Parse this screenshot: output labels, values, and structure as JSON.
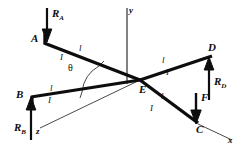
{
  "figure": {
    "background": "#ffffff",
    "ink": "#0d0d0d",
    "width": 237,
    "height": 149
  },
  "joints": {
    "a": {
      "label": "A",
      "x": 43,
      "y": 40
    },
    "b": {
      "label": "B",
      "x": 30,
      "y": 100
    },
    "c": {
      "label": "C",
      "x": 198,
      "y": 124
    },
    "d": {
      "label": "D",
      "x": 212,
      "y": 55
    },
    "e": {
      "label": "E",
      "x": 140,
      "y": 80
    }
  },
  "forces": [
    {
      "name": "R_A",
      "base": "R",
      "sub": "A",
      "direction": "down",
      "at": "A"
    },
    {
      "name": "R_B",
      "base": "R",
      "sub": "B",
      "direction": "up",
      "at": "B"
    },
    {
      "name": "R_D",
      "base": "R",
      "sub": "D",
      "direction": "up",
      "at": "D"
    },
    {
      "name": "F",
      "base": "F",
      "sub": "",
      "direction": "down",
      "at": "C"
    }
  ],
  "axes": [
    {
      "label": "y",
      "orientation": "vertical-up"
    },
    {
      "label": "z",
      "orientation": "down-left"
    },
    {
      "label": "x",
      "orientation": "down-right"
    }
  ],
  "angle": {
    "symbol": "θ",
    "name": "theta",
    "between": "AE-and-BE"
  },
  "segment_labels": {
    "length": "l",
    "inertia": "I",
    "segments": [
      {
        "id": "AE",
        "length": "l",
        "inertia": "I"
      },
      {
        "id": "BE",
        "length": "l",
        "inertia": "I"
      },
      {
        "id": "ED",
        "length": "l",
        "inertia": "I"
      },
      {
        "id": "EC",
        "length": "l",
        "inertia": "I"
      }
    ]
  }
}
